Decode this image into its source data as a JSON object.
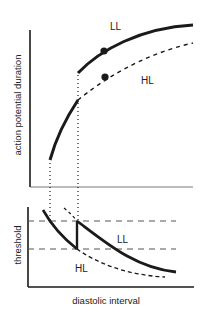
{
  "upper_panel": {
    "ylabel": "action potential duration",
    "curve_labels": {
      "ll": "LL",
      "hl": "HL"
    }
  },
  "lower_panel": {
    "ylabel": "threshold",
    "xlabel": "diastolic interval",
    "curve_labels": {
      "ll": "LL",
      "hl": "HL"
    }
  },
  "colors": {
    "line": "#1a1a1a",
    "background": "#ffffff"
  }
}
